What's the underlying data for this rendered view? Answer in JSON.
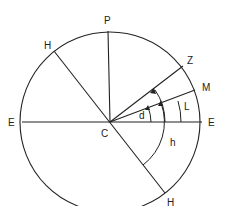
{
  "diagram": {
    "type": "celestial-sphere",
    "center": {
      "label": "C",
      "x": 110,
      "y": 122
    },
    "radius": 90,
    "stroke_color": "#222222",
    "points": [
      {
        "id": "P",
        "label": "P",
        "x": 108,
        "y": 31,
        "lx": 108,
        "ly": 22
      },
      {
        "id": "H_upper",
        "label": "H",
        "x": 54,
        "y": 51,
        "lx": 47,
        "ly": 47
      },
      {
        "id": "Z",
        "label": "Z",
        "x": 183,
        "y": 66,
        "lx": 190,
        "ly": 62
      },
      {
        "id": "M",
        "label": "M",
        "x": 195,
        "y": 90,
        "lx": 206,
        "ly": 90
      },
      {
        "id": "E_left",
        "label": "E",
        "x": 22,
        "y": 122,
        "lx": 13,
        "ly": 125
      },
      {
        "id": "E_right",
        "label": "E",
        "x": 202,
        "y": 122,
        "lx": 212,
        "ly": 125
      },
      {
        "id": "H_lower",
        "label": "H",
        "x": 165,
        "y": 193,
        "lx": 171,
        "ly": 204
      }
    ],
    "center_label": {
      "text": "C",
      "x": 104,
      "y": 136
    },
    "angles": [
      {
        "label": "d",
        "text": "d",
        "x": 144,
        "y": 118
      },
      {
        "label": "L",
        "text": "L",
        "x": 188,
        "y": 109
      },
      {
        "label": "h",
        "text": "h",
        "x": 173,
        "y": 145
      }
    ]
  }
}
